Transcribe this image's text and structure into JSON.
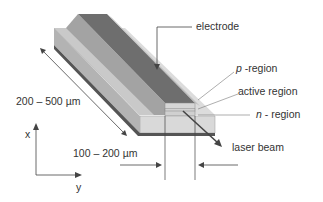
{
  "diagram": {
    "type": "laser-diode-structure",
    "labels": {
      "electrode": "electrode",
      "p_region_italic": "p",
      "p_region_rest": " -region",
      "active_region": "active region",
      "n_region_italic": "n",
      "n_region_rest": " - region",
      "laser_beam": "laser beam",
      "length_dim": "200 – 500 µm",
      "width_dim": "100 – 200 µm",
      "axis_x": "x",
      "axis_y": "y"
    },
    "colors": {
      "electrode": "#6e6e6e",
      "electrode_side": "#8a8a8a",
      "slab_top_light": "#d4d4d4",
      "slab_top_mid": "#bdbdbd",
      "slab_side": "#9a9a9a",
      "slab_front": "#d9d9d9",
      "slab_bottom_edge": "#555555",
      "active_layer": "#e6e6e6",
      "lines": "#444444"
    }
  }
}
